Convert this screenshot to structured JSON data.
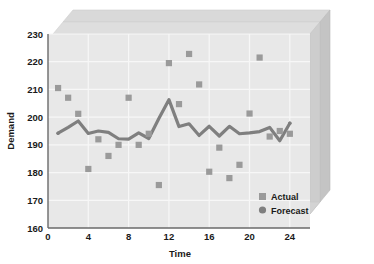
{
  "chart_data": {
    "type": "line",
    "title": "",
    "xlabel": "Time",
    "ylabel": "Demand",
    "xlim": [
      0,
      26
    ],
    "ylim": [
      160,
      230
    ],
    "xticks": [
      0,
      4,
      8,
      12,
      16,
      20,
      24
    ],
    "yticks": [
      160,
      170,
      180,
      190,
      200,
      210,
      220,
      230
    ],
    "grid": true,
    "legend_position": "inside-bottom-right",
    "style": "3d-walls",
    "x": [
      1,
      2,
      3,
      4,
      5,
      6,
      7,
      8,
      9,
      10,
      11,
      12,
      13,
      14,
      15,
      16,
      17,
      18,
      19,
      20,
      21,
      22,
      23,
      24
    ],
    "series": [
      {
        "name": "Actual",
        "marker": "square",
        "color": "#9a9a9a",
        "style": "markers",
        "values": [
          210.5,
          207,
          201.2,
          181.3,
          192,
          186,
          190,
          207,
          190,
          194,
          175.5,
          219.5,
          204.7,
          222.8,
          211.8,
          180.3,
          189,
          178,
          182.8,
          201.3,
          221.5,
          193,
          195,
          194
        ]
      },
      {
        "name": "Forecast",
        "marker": "circle",
        "color": "#7f7f7f",
        "style": "line",
        "values": [
          194.2,
          196.3,
          198.6,
          194.1,
          195,
          194.5,
          192.2,
          192.1,
          194.3,
          192.3,
          199.5,
          206.3,
          196.6,
          197.6,
          193.4,
          196.7,
          193.2,
          196.7,
          194,
          194.3,
          194.8,
          196.3,
          191.5,
          197.8
        ]
      }
    ],
    "legend": [
      {
        "label": "Actual",
        "marker": "square",
        "color": "#9a9a9a"
      },
      {
        "label": "Forecast",
        "marker": "circle",
        "color": "#7f7f7f"
      }
    ],
    "colors": {
      "plot_background": "#e8e8e8",
      "wall_top": "#d6d6d6",
      "wall_side": "#c9c9c9",
      "wall_shadow": "#b8b8b8",
      "gridline": "#f7f7f7",
      "actual": "#9a9a9a",
      "forecast": "#7f7f7f",
      "text": "#1a1a1a"
    }
  }
}
